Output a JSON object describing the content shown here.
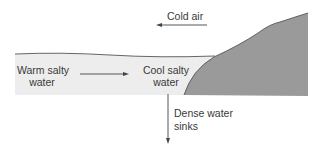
{
  "diagram": {
    "labels": {
      "cold_air": "Cold air",
      "warm_water_line1": "Warm salty",
      "warm_water_line2": "water",
      "cool_water_line1": "Cool salty",
      "cool_water_line2": "water",
      "dense_line1": "Dense water",
      "dense_line2": "sinks"
    },
    "colors": {
      "water": "#ededed",
      "land": "#9a9a9a",
      "land_edge": "#555555",
      "lines": "#444444",
      "text": "#3a3a3a"
    },
    "arrows": [
      {
        "name": "cold-air-arrow",
        "direction": "left"
      },
      {
        "name": "water-flow-arrow",
        "direction": "right"
      },
      {
        "name": "sinking-arrow",
        "direction": "down"
      }
    ]
  }
}
